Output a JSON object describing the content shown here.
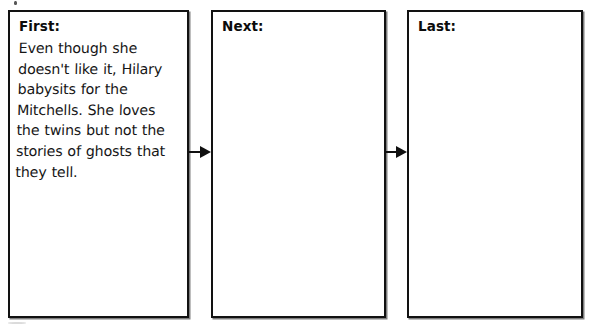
{
  "document": {
    "title": "Sequence Graphic Organizer",
    "type": "worksheet"
  },
  "panels": [
    {
      "id": "first",
      "label": "First:",
      "body": "Even though she doesn't like it, Hilary babysits for the Mitchells. She loves the twins but not the stories of ghosts that they tell.",
      "filled": true
    },
    {
      "id": "next",
      "label": "Next:",
      "body": "",
      "filled": false
    },
    {
      "id": "last",
      "label": "Last:",
      "body": "",
      "filled": false
    }
  ],
  "connectors": [
    {
      "id": "first-to-next",
      "icon": "arrow-right-icon",
      "from": "first",
      "to": "next"
    },
    {
      "id": "next-to-last",
      "icon": "arrow-right-icon",
      "from": "next",
      "to": "last"
    }
  ],
  "colors": {
    "ink": "#121212",
    "handwriting": "#161616",
    "background": "#ffffff"
  }
}
